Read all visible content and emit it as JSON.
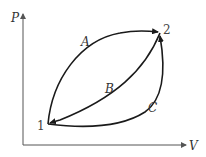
{
  "diagram": {
    "axes": {
      "y_label": "P",
      "x_label": "V"
    },
    "states": [
      {
        "id": "1",
        "label": "1"
      },
      {
        "id": "2",
        "label": "2"
      }
    ],
    "paths": [
      {
        "id": "A",
        "label": "A",
        "from": "1",
        "to": "2",
        "shape": "upper curve"
      },
      {
        "id": "B",
        "label": "B",
        "from": "2",
        "to": "1",
        "shape": "middle curve"
      },
      {
        "id": "C",
        "label": "C",
        "from": "1",
        "to": "2",
        "shape": "lower curve"
      }
    ],
    "colors": {
      "curve": "#1a1a1a",
      "axis": "#555555"
    }
  }
}
